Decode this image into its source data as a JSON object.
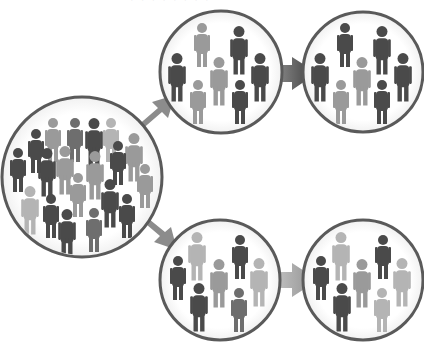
{
  "caption": "· · · · · · · ·",
  "colors": {
    "background": "#ffffff",
    "ring": "#5a5a5a",
    "arrow_dark": "#5e5e5e",
    "arrow_mid": "#8c8c8c",
    "arrow_light": "#a3a3a3",
    "person_dark": "#4a4a4a",
    "person_mid": "#6e6e6e",
    "person_light": "#9a9a9a",
    "person_pale": "#b4b4b4"
  },
  "diagram": {
    "nodes": [
      {
        "id": "population",
        "label": "Population",
        "cx": 82,
        "cy": 177,
        "r": 80,
        "people": [
          {
            "x": 53,
            "y": 117,
            "s": 1.0,
            "t": "person_light"
          },
          {
            "x": 75,
            "y": 117,
            "s": 1.0,
            "t": "person_mid"
          },
          {
            "x": 94,
            "y": 117,
            "s": 1.1,
            "t": "person_dark"
          },
          {
            "x": 111,
            "y": 117,
            "s": 1.0,
            "t": "person_pale"
          },
          {
            "x": 36,
            "y": 128,
            "s": 1.0,
            "t": "person_dark"
          },
          {
            "x": 134,
            "y": 132,
            "s": 1.1,
            "t": "person_light"
          },
          {
            "x": 18,
            "y": 147,
            "s": 1.0,
            "t": "person_dark"
          },
          {
            "x": 47,
            "y": 147,
            "s": 1.1,
            "t": "person_dark"
          },
          {
            "x": 65,
            "y": 145,
            "s": 1.1,
            "t": "person_light"
          },
          {
            "x": 95,
            "y": 150,
            "s": 1.1,
            "t": "person_light"
          },
          {
            "x": 118,
            "y": 140,
            "s": 1.0,
            "t": "person_dark"
          },
          {
            "x": 145,
            "y": 163,
            "s": 1.0,
            "t": "person_light"
          },
          {
            "x": 30,
            "y": 185,
            "s": 1.1,
            "t": "person_pale"
          },
          {
            "x": 78,
            "y": 172,
            "s": 1.0,
            "t": "person_light"
          },
          {
            "x": 110,
            "y": 178,
            "s": 1.1,
            "t": "person_dark"
          },
          {
            "x": 51,
            "y": 193,
            "s": 1.0,
            "t": "person_dark"
          },
          {
            "x": 127,
            "y": 193,
            "s": 1.0,
            "t": "person_dark"
          },
          {
            "x": 67,
            "y": 208,
            "s": 1.1,
            "t": "person_dark"
          },
          {
            "x": 94,
            "y": 207,
            "s": 1.0,
            "t": "person_mid"
          }
        ]
      },
      {
        "id": "sample-a",
        "label": "Sample A",
        "cx": 221,
        "cy": 72,
        "r": 61,
        "people": [
          {
            "x": 202,
            "y": 22,
            "s": 1.0,
            "t": "person_light"
          },
          {
            "x": 239,
            "y": 25,
            "s": 1.1,
            "t": "person_dark"
          },
          {
            "x": 177,
            "y": 52,
            "s": 1.1,
            "t": "person_dark"
          },
          {
            "x": 219,
            "y": 56,
            "s": 1.1,
            "t": "person_light"
          },
          {
            "x": 260,
            "y": 52,
            "s": 1.1,
            "t": "person_dark"
          },
          {
            "x": 198,
            "y": 79,
            "s": 1.0,
            "t": "person_light"
          },
          {
            "x": 240,
            "y": 79,
            "s": 1.0,
            "t": "person_dark"
          }
        ]
      },
      {
        "id": "sample-a-next",
        "label": "Sample A (repeated)",
        "cx": 363,
        "cy": 72,
        "r": 60,
        "people": [
          {
            "x": 345,
            "y": 22,
            "s": 1.0,
            "t": "person_dark"
          },
          {
            "x": 382,
            "y": 25,
            "s": 1.1,
            "t": "person_dark"
          },
          {
            "x": 320,
            "y": 52,
            "s": 1.1,
            "t": "person_dark"
          },
          {
            "x": 362,
            "y": 56,
            "s": 1.1,
            "t": "person_light"
          },
          {
            "x": 403,
            "y": 52,
            "s": 1.1,
            "t": "person_dark"
          },
          {
            "x": 341,
            "y": 79,
            "s": 1.0,
            "t": "person_light"
          },
          {
            "x": 382,
            "y": 79,
            "s": 1.0,
            "t": "person_dark"
          }
        ]
      },
      {
        "id": "sample-b",
        "label": "Sample B",
        "cx": 220,
        "cy": 280,
        "r": 60,
        "people": [
          {
            "x": 197,
            "y": 231,
            "s": 1.1,
            "t": "person_pale"
          },
          {
            "x": 240,
            "y": 234,
            "s": 1.0,
            "t": "person_dark"
          },
          {
            "x": 178,
            "y": 255,
            "s": 1.0,
            "t": "person_dark"
          },
          {
            "x": 219,
            "y": 258,
            "s": 1.1,
            "t": "person_light"
          },
          {
            "x": 259,
            "y": 257,
            "s": 1.1,
            "t": "person_pale"
          },
          {
            "x": 199,
            "y": 282,
            "s": 1.1,
            "t": "person_dark"
          },
          {
            "x": 239,
            "y": 287,
            "s": 1.0,
            "t": "person_mid"
          }
        ]
      },
      {
        "id": "sample-b-next",
        "label": "Sample B (repeated)",
        "cx": 363,
        "cy": 280,
        "r": 60,
        "people": [
          {
            "x": 341,
            "y": 231,
            "s": 1.1,
            "t": "person_pale"
          },
          {
            "x": 383,
            "y": 234,
            "s": 1.0,
            "t": "person_dark"
          },
          {
            "x": 321,
            "y": 255,
            "s": 1.0,
            "t": "person_dark"
          },
          {
            "x": 362,
            "y": 258,
            "s": 1.1,
            "t": "person_light"
          },
          {
            "x": 402,
            "y": 257,
            "s": 1.1,
            "t": "person_pale"
          },
          {
            "x": 342,
            "y": 282,
            "s": 1.1,
            "t": "person_dark"
          },
          {
            "x": 382,
            "y": 287,
            "s": 1.0,
            "t": "person_pale"
          }
        ]
      }
    ],
    "edges": [
      {
        "from": "population",
        "to": "sample-a",
        "style": "arrow_mid"
      },
      {
        "from": "population",
        "to": "sample-b",
        "style": "arrow_mid"
      },
      {
        "from": "sample-a",
        "to": "sample-a-next",
        "style": "arrow_dark"
      },
      {
        "from": "sample-b",
        "to": "sample-b-next",
        "style": "arrow_light"
      }
    ]
  }
}
